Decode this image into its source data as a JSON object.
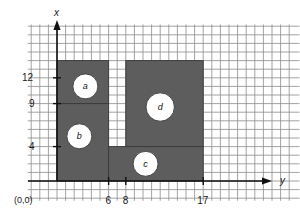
{
  "figure": {
    "title": "",
    "axes": {
      "vertical_label": "x",
      "horizontal_label": "y",
      "origin_label": "(0,0)"
    },
    "vertical_ticks": [
      {
        "value": 12,
        "label": "12"
      },
      {
        "value": 9,
        "label": "9"
      },
      {
        "value": 4,
        "label": "4"
      }
    ],
    "horizontal_ticks": [
      {
        "value": 6,
        "label": "6"
      },
      {
        "value": 8,
        "label": "8"
      },
      {
        "value": 17,
        "label": "17"
      }
    ],
    "colors": {
      "region_fill": "#5d5d5d",
      "region_edge": "#3a3a3a",
      "grid_line": "#8c8c8c",
      "axis_line": "#111111",
      "hole_fill": "#ffffff",
      "background": "#ffffff"
    },
    "grid": {
      "enabled": true,
      "unit_px": 8.6,
      "x_units_min": -2,
      "x_units_max": 28,
      "y_units_min": -2,
      "y_units_max": 17
    },
    "region": {
      "name": "shaded-part-cross-section",
      "description": "hatched/solid gray machined part outline",
      "rectangles": [
        {
          "name": "upper-left-block",
          "y0": 0,
          "y1": 6,
          "x0": 9,
          "x1": 14
        },
        {
          "name": "left-main-block",
          "y0": 0,
          "y1": 6,
          "x0": 0,
          "x1": 9
        },
        {
          "name": "right-upper-block",
          "y0": 8,
          "y1": 17,
          "x0": 4,
          "x1": 14
        },
        {
          "name": "lower-right-block",
          "y0": 6,
          "y1": 17,
          "x0": 0,
          "x1": 4
        }
      ],
      "slot": {
        "name": "center-slot",
        "y0": 6,
        "y1": 8,
        "x0": 4,
        "x1": 9
      }
    },
    "circles": [
      {
        "id": "a",
        "label": "a",
        "y": 3.3,
        "x": 11.0,
        "r_units": 1.45
      },
      {
        "id": "b",
        "label": "b",
        "y": 2.6,
        "x": 5.2,
        "r_units": 1.45
      },
      {
        "id": "c",
        "label": "c",
        "y": 10.3,
        "x": 2.0,
        "r_units": 1.45
      },
      {
        "id": "d",
        "label": "d",
        "y": 12.0,
        "x": 8.6,
        "r_units": 1.65
      }
    ]
  }
}
